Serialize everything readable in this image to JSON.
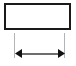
{
  "canvas": {
    "width": 76,
    "height": 66,
    "background_color": "#ffffff"
  },
  "diagram": {
    "type": "dimensioned-rectangle",
    "title": "",
    "shape": {
      "name": "rectangle",
      "x": 4,
      "y": 3,
      "width": 67,
      "height": 27,
      "stroke_color": "#1a1a1a",
      "stroke_width": 2,
      "fill_color": "#ffffff",
      "interior_label": ""
    },
    "dimension": {
      "name": "width-dimension",
      "orientation": "horizontal",
      "label": "",
      "line_y": 53.5,
      "start_x": 15,
      "end_x": 65,
      "line_color": "#6e6e6e",
      "line_width": 2,
      "arrowhead_style": "solid-filled-triangle",
      "arrowhead_color": "#111111",
      "arrowhead_length": 7,
      "arrowhead_half_height": 4.5,
      "left_arrow_name": "left-arrowhead",
      "right_arrow_name": "right-arrowhead"
    },
    "extension_lines": [
      {
        "name": "extension-line-left",
        "x": 14.5,
        "y_top": 33,
        "y_bottom": 58,
        "color": "#b4b4b4",
        "width": 1
      },
      {
        "name": "extension-line-right",
        "x": 64.5,
        "y_top": 33,
        "y_bottom": 58,
        "color": "#b4b4b4",
        "width": 1
      }
    ]
  }
}
